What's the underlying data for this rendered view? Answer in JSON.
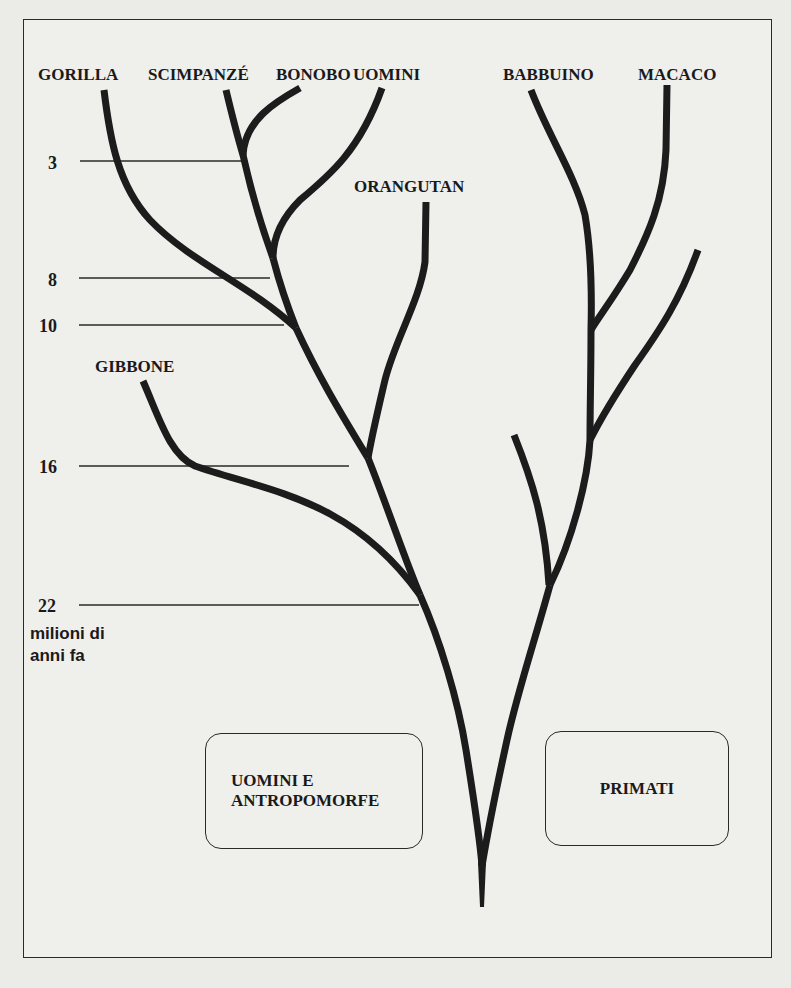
{
  "diagram": {
    "type": "phylogenetic-tree",
    "colors": {
      "background": "#efefec",
      "ink": "#1a1a1a"
    },
    "species_labels": {
      "gorilla": "GORILLA",
      "chimpanzee": "SCIMPANZÉ",
      "bonobo": "BONOBO",
      "human": "UOMINI",
      "orangutan": "ORANGUTAN",
      "gibbon": "GIBBONE",
      "baboon": "BABBUINO",
      "macaque": "MACACO"
    },
    "time_axis": {
      "ticks": [
        "3",
        "8",
        "10",
        "16",
        "22"
      ],
      "unit_line1": "milioni di",
      "unit_line2": "anni fa"
    },
    "groups": {
      "apes_line1": "UOMINI E",
      "apes_line2": "ANTROPOMORFE",
      "primates": "PRIMATI"
    }
  }
}
